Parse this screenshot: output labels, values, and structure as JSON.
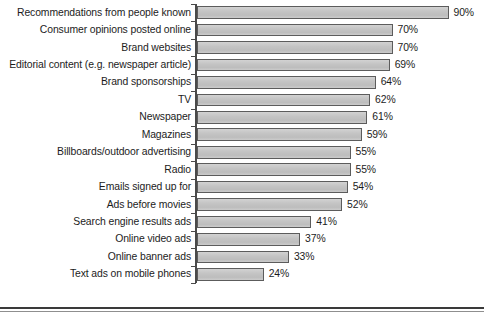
{
  "chart_data": {
    "type": "bar",
    "orientation": "horizontal",
    "title": "",
    "xlabel": "",
    "ylabel": "",
    "xlim": [
      0,
      100
    ],
    "grid": false,
    "legend": null,
    "value_suffix": "%",
    "categories": [
      "Recommendations from people known",
      "Consumer opinions posted online",
      "Brand websites",
      "Editorial content (e.g. newspaper article)",
      "Brand sponsorships",
      "TV",
      "Newspaper",
      "Magazines",
      "Billboards/outdoor advertising",
      "Radio",
      "Emails signed up for",
      "Ads before movies",
      "Search engine results ads",
      "Online video ads",
      "Online banner ads",
      "Text ads on mobile phones"
    ],
    "values": [
      90,
      70,
      70,
      69,
      64,
      62,
      61,
      59,
      55,
      55,
      54,
      52,
      41,
      37,
      33,
      24
    ],
    "value_labels": [
      "90%",
      "70%",
      "70%",
      "69%",
      "64%",
      "62%",
      "61%",
      "59%",
      "55%",
      "55%",
      "54%",
      "52%",
      "41%",
      "37%",
      "33%",
      "24%"
    ],
    "colors": {
      "bar_fill": "#c6c6c6",
      "bar_edge": "#5c5c5c",
      "axis": "#4a4a4a",
      "text": "#1c1c1c",
      "background": "#ffffff"
    }
  }
}
